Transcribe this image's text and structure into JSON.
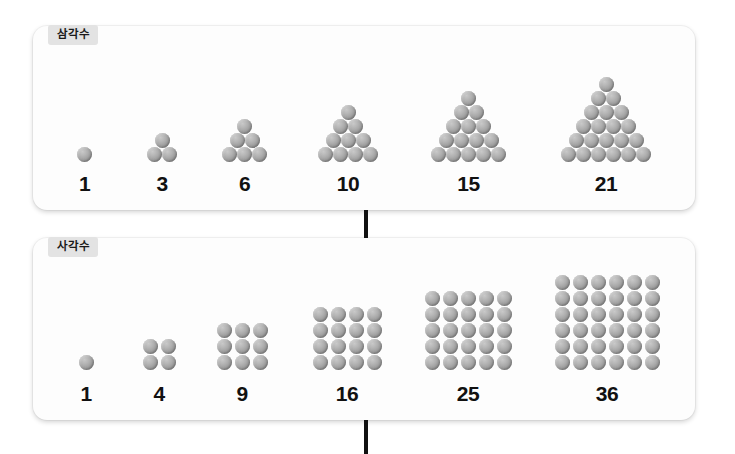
{
  "page": {
    "background": "#ffffff",
    "dot_color": "#a3a3a3"
  },
  "sections": [
    {
      "id": "triangular",
      "label": "삼각수",
      "shape": "triangle",
      "groups": [
        {
          "caption": "1",
          "rows": [
            1
          ]
        },
        {
          "caption": "3",
          "rows": [
            1,
            2
          ]
        },
        {
          "caption": "6",
          "rows": [
            1,
            2,
            3
          ]
        },
        {
          "caption": "10",
          "rows": [
            1,
            2,
            3,
            4
          ]
        },
        {
          "caption": "15",
          "rows": [
            1,
            2,
            3,
            4,
            5
          ]
        },
        {
          "caption": "21",
          "rows": [
            1,
            2,
            3,
            4,
            5,
            6
          ]
        }
      ]
    },
    {
      "id": "square",
      "label": "사각수",
      "shape": "square",
      "groups": [
        {
          "caption": "1",
          "rows": [
            1
          ]
        },
        {
          "caption": "4",
          "rows": [
            2,
            2
          ]
        },
        {
          "caption": "9",
          "rows": [
            3,
            3,
            3
          ]
        },
        {
          "caption": "16",
          "rows": [
            4,
            4,
            4,
            4
          ]
        },
        {
          "caption": "25",
          "rows": [
            5,
            5,
            5,
            5,
            5
          ]
        },
        {
          "caption": "36",
          "rows": [
            6,
            6,
            6,
            6,
            6,
            6
          ]
        }
      ]
    }
  ],
  "connectors": [
    {
      "id": "connector-top",
      "color": "#111111"
    },
    {
      "id": "connector-bottom",
      "color": "#111111"
    }
  ]
}
